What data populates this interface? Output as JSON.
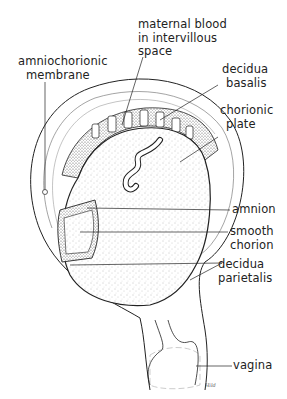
{
  "diagram": {
    "type": "anatomical-illustration",
    "labels": [
      {
        "id": "maternal-blood",
        "lines": [
          "maternal blood",
          "in intervillous",
          "space"
        ]
      },
      {
        "id": "amniochorionic-membrane",
        "lines": [
          "amniochorionic",
          "membrane"
        ]
      },
      {
        "id": "decidua-basalis",
        "lines": [
          "decidua",
          "basalis"
        ]
      },
      {
        "id": "chorionic-plate",
        "lines": [
          "chorionic",
          "plate"
        ]
      },
      {
        "id": "amnion",
        "lines": [
          "amnion"
        ]
      },
      {
        "id": "smooth-chorion",
        "lines": [
          "smooth",
          "chorion"
        ]
      },
      {
        "id": "decidua-parietalis",
        "lines": [
          "decidua",
          "parietalis"
        ]
      },
      {
        "id": "vagina",
        "lines": [
          "vagina"
        ]
      }
    ],
    "signature": "Hild",
    "colors": {
      "ink": "#222222",
      "background": "#ffffff",
      "stipple": "#888888"
    }
  }
}
